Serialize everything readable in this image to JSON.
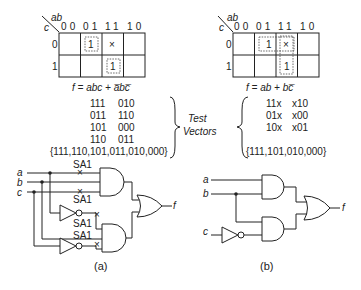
{
  "panel_a": {
    "kmap": {
      "row_var": "c",
      "col_var": "ab",
      "col_headers": [
        "00",
        "01",
        "11",
        "10"
      ],
      "row_headers": [
        "0",
        "1"
      ],
      "cells": [
        [
          "",
          "1",
          "×",
          ""
        ],
        [
          "",
          "",
          "1",
          ""
        ]
      ]
    },
    "equation": "f = abc + a̅bc̅",
    "test_vectors": {
      "rows": [
        [
          "111",
          "010"
        ],
        [
          "011",
          "110"
        ],
        [
          "101",
          "000"
        ],
        [
          "110",
          "011"
        ]
      ],
      "set": "{111,110,101,011,010,000}"
    },
    "circuit": {
      "inputs": [
        "a",
        "b",
        "c"
      ],
      "output": "f",
      "faults": [
        "SA1",
        "SA1",
        "SA1",
        "SA1"
      ]
    },
    "caption": "(a)"
  },
  "panel_b": {
    "kmap": {
      "row_var": "c",
      "col_var": "ab",
      "col_headers": [
        "00",
        "01",
        "11",
        "10"
      ],
      "row_headers": [
        "0",
        "1"
      ],
      "cells": [
        [
          "",
          "1",
          "×",
          ""
        ],
        [
          "",
          "",
          "1",
          ""
        ]
      ]
    },
    "equation": "f = ab + bc̅",
    "test_vectors": {
      "rows": [
        [
          "11x",
          "x10"
        ],
        [
          "01x",
          "x00"
        ],
        [
          "10x",
          "x01"
        ]
      ],
      "set": "{111,101,010,000}"
    },
    "circuit": {
      "inputs": [
        "a",
        "b",
        "c"
      ],
      "output": "f"
    },
    "caption": "(b)"
  },
  "center_label": {
    "line1": "Test",
    "line2": "Vectors"
  }
}
